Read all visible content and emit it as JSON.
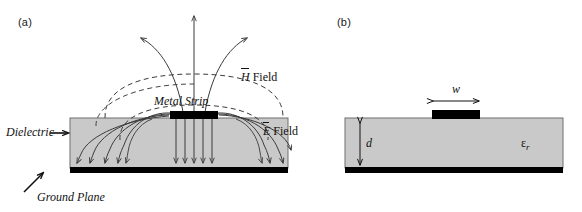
{
  "figure": {
    "type": "diagram",
    "background_color": "#ffffff",
    "width": 582,
    "height": 212
  },
  "colors": {
    "dielectric_fill": "#c9c9c9",
    "dielectric_stroke": "#6e6e6e",
    "conductor": "#000000",
    "field_line": "#3b3b3b",
    "dashed_field": "#3b3b3b",
    "text": "#111111"
  },
  "panel_a": {
    "label": "(a)",
    "annotations": {
      "dielectric": "Dielectric",
      "metal_strip": "Metal Strip",
      "ground_plane": "Ground Plane",
      "h_field_symbol": "H",
      "h_field_word": "Field",
      "e_field_symbol": "E",
      "e_field_word": "Field"
    },
    "geometry": {
      "substrate_left": 70,
      "substrate_right": 288,
      "substrate_top": 118,
      "substrate_bottom": 168,
      "strip_left": 170,
      "strip_right": 218,
      "strip_top": 112,
      "strip_height": 7,
      "ground_top": 168,
      "ground_height": 6
    },
    "e_field_lines": {
      "count_above": 3,
      "count_in_substrate": 12,
      "description": "Electric field lines emanate from the metal strip, fringe outward through air and dielectric, and terminate with arrowheads on the ground plane."
    },
    "h_field_lines": {
      "count": 3,
      "style": "dashed",
      "description": "Dashed magnetic field loops encircle the metal strip."
    }
  },
  "panel_b": {
    "label": "(b)",
    "annotations": {
      "width_symbol": "w",
      "thickness_symbol": "d",
      "permittivity_symbol": "ε",
      "permittivity_subscript": "r"
    },
    "geometry": {
      "substrate_left": 345,
      "substrate_right": 563,
      "substrate_top": 118,
      "substrate_bottom": 168,
      "strip_left": 432,
      "strip_right": 480,
      "strip_top": 110,
      "strip_height": 8,
      "ground_top": 168,
      "ground_height": 6,
      "w_arrow_y": 100,
      "d_arrow_x": 360
    }
  }
}
